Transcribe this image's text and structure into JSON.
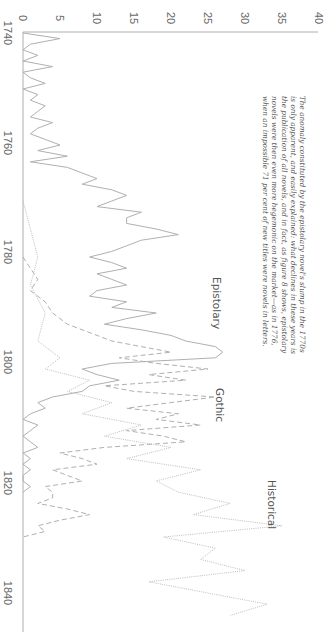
{
  "chart_data": {
    "type": "line",
    "orientation": "rotated-90-clockwise",
    "title": "",
    "xlabel": "",
    "ylabel": "",
    "x_ticks": [
      1740,
      1760,
      1780,
      1800,
      1820,
      1840
    ],
    "y_ticks": [
      0,
      5,
      10,
      15,
      20,
      25,
      30,
      35,
      40
    ],
    "xlim": [
      1740,
      1845
    ],
    "ylim": [
      0,
      40
    ],
    "grid": false,
    "legend": "inline labels",
    "annotation": [
      "The anomaly constituted by the epistolary novel's slump in the 1770s",
      "is only apparent, and easily explained: what declines in these years is",
      "the publication of all novels, and in fact, as figure 8 shows, epistolary",
      "novels were then even more hegemonic on the market—as in 1776,",
      "when an impossible 71 per cent of new titles were novels in letters."
    ],
    "series": [
      {
        "name": "Epistolary",
        "style": "solid",
        "x": [
          1740,
          1741,
          1742,
          1743,
          1744,
          1745,
          1746,
          1747,
          1748,
          1749,
          1750,
          1751,
          1752,
          1753,
          1754,
          1755,
          1756,
          1757,
          1758,
          1759,
          1760,
          1761,
          1762,
          1763,
          1764,
          1765,
          1766,
          1767,
          1768,
          1769,
          1770,
          1771,
          1772,
          1773,
          1774,
          1775,
          1776,
          1777,
          1778,
          1779,
          1780,
          1781,
          1782,
          1783,
          1784,
          1785,
          1786,
          1787,
          1788,
          1789,
          1790,
          1791,
          1792,
          1793,
          1794,
          1795,
          1796,
          1797,
          1798,
          1799,
          1800,
          1801,
          1802,
          1803,
          1804,
          1805,
          1806,
          1807,
          1808,
          1809,
          1810,
          1811,
          1812,
          1813,
          1814,
          1815,
          1816,
          1817,
          1818,
          1819,
          1820,
          1821,
          1822
        ],
        "values": [
          0,
          5,
          1,
          0,
          2,
          0,
          4,
          0,
          1,
          3,
          0,
          2,
          1,
          3,
          2,
          1,
          4,
          2,
          1,
          3,
          5,
          2,
          6,
          1,
          6,
          8,
          10,
          8,
          12,
          14,
          12,
          10,
          16,
          14,
          14,
          18,
          21,
          16,
          14,
          12,
          9,
          12,
          14,
          10,
          12,
          14,
          10,
          9,
          14,
          12,
          18,
          14,
          11,
          16,
          20,
          22,
          26,
          27,
          26,
          12,
          8,
          10,
          13,
          9,
          8,
          4,
          2,
          3,
          1,
          0,
          2,
          1,
          0,
          1,
          2,
          0,
          1,
          0,
          1,
          0,
          0,
          1,
          0
        ]
      },
      {
        "name": "Gothic",
        "style": "dashed",
        "x": [
          1780,
          1782,
          1784,
          1786,
          1788,
          1790,
          1792,
          1794,
          1795,
          1796,
          1797,
          1798,
          1799,
          1800,
          1801,
          1802,
          1803,
          1804,
          1805,
          1806,
          1807,
          1808,
          1809,
          1810,
          1811,
          1812,
          1813,
          1814,
          1815,
          1816,
          1817,
          1818,
          1819,
          1820,
          1821,
          1822,
          1823,
          1824,
          1825,
          1826,
          1827,
          1828,
          1829,
          1830
        ],
        "values": [
          0,
          1,
          2,
          1,
          3,
          4,
          6,
          10,
          12,
          16,
          20,
          13,
          18,
          25,
          17,
          22,
          11,
          15,
          26,
          20,
          14,
          21,
          18,
          24,
          14,
          19,
          22,
          11,
          5,
          8,
          10,
          4,
          6,
          8,
          3,
          4,
          4,
          2,
          6,
          9,
          5,
          2,
          3,
          0
        ]
      },
      {
        "name": "Historical",
        "style": "dotted",
        "x": [
          1770,
          1775,
          1780,
          1785,
          1790,
          1795,
          1798,
          1800,
          1802,
          1804,
          1806,
          1808,
          1810,
          1812,
          1814,
          1816,
          1818,
          1820,
          1822,
          1824,
          1826,
          1828,
          1830,
          1832,
          1834,
          1836,
          1838,
          1840,
          1842,
          1844
        ],
        "values": [
          0,
          1,
          2,
          1,
          3,
          2,
          5,
          3,
          9,
          6,
          12,
          8,
          16,
          11,
          20,
          14,
          24,
          18,
          21,
          28,
          23,
          35,
          19,
          26,
          24,
          30,
          17,
          25,
          33,
          28
        ]
      }
    ]
  }
}
